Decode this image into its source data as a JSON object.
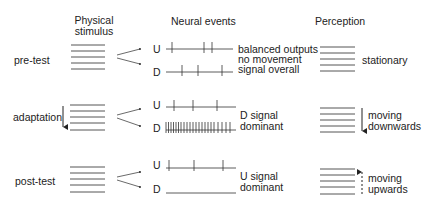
{
  "headers": {
    "stimulus_line1": "Physical",
    "stimulus_line2": "stimulus",
    "neural": "Neural events",
    "perception": "Perception"
  },
  "rows": [
    {
      "label": "pre-test",
      "u_label": "U",
      "d_label": "D",
      "neural_note": [
        "balanced outputs",
        "no movement",
        "signal overall"
      ],
      "perception": [
        "stationary"
      ]
    },
    {
      "label": "adaptation",
      "u_label": "U",
      "d_label": "D",
      "neural_note": [
        "D signal",
        "dominant"
      ],
      "perception": [
        "moving",
        "downwards"
      ]
    },
    {
      "label": "post-test",
      "u_label": "U",
      "d_label": "D",
      "neural_note": [
        "U signal",
        "dominant"
      ],
      "perception": [
        "moving",
        "upwards"
      ]
    }
  ],
  "colors": {
    "ink": "#222222",
    "line": "#555555"
  }
}
